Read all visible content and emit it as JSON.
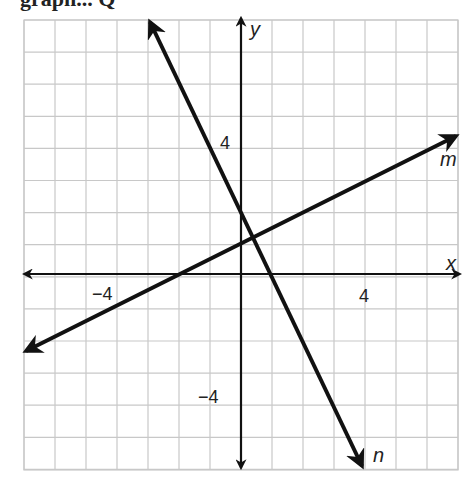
{
  "header": {
    "partial_text": "graph... Q"
  },
  "chart_data": {
    "type": "line",
    "title": "",
    "xlabel": "x",
    "ylabel": "y",
    "xlim": [
      -7,
      7
    ],
    "ylim": [
      -6,
      8
    ],
    "grid": true,
    "tick_labels": {
      "x": [
        "-4",
        "4"
      ],
      "y": [
        "4",
        "-4"
      ]
    },
    "series": [
      {
        "name": "m",
        "equation": "y = 0.5x + 1",
        "slope": 0.5,
        "intercept": 1,
        "x": [
          -7,
          7
        ],
        "y": [
          -2.5,
          4.5
        ]
      },
      {
        "name": "n",
        "equation": "y = -2x + 2",
        "slope": -2,
        "intercept": 2,
        "x": [
          -3,
          4
        ],
        "y": [
          8,
          -6
        ]
      }
    ],
    "intersection": {
      "x": 0.4,
      "y": 1.2
    }
  },
  "labels": {
    "x_axis": "x",
    "y_axis": "y",
    "x_neg4": "−4",
    "x_pos4": "4",
    "y_pos4": "4",
    "y_neg4": "−4",
    "line_m": "m",
    "line_n": "n"
  },
  "colors": {
    "grid": "#c8c8c8",
    "lines": "#111111",
    "background": "#ffffff"
  }
}
